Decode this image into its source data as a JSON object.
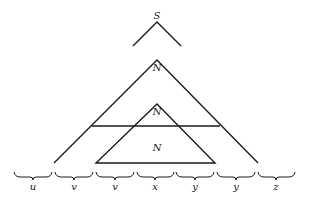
{
  "diagram": {
    "type": "parse-tree-pumping-lemma",
    "root_label": "S",
    "outer_node_label": "N",
    "inner_node_label": "N",
    "inner_triangle_label": "N",
    "segments": [
      {
        "label": "u"
      },
      {
        "label": "v"
      },
      {
        "label": "v"
      },
      {
        "label": "x"
      },
      {
        "label": "y"
      },
      {
        "label": "y"
      },
      {
        "label": "z"
      }
    ]
  }
}
